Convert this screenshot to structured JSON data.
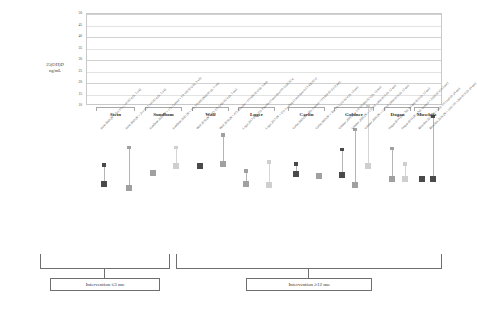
{
  "figure": {
    "ylabel_line1": "25(OH)D",
    "ylabel_line2": "ng/mL"
  },
  "brackets": [
    {
      "label": "Intervention ≤3 mo"
    },
    {
      "label": "Intervention ≥12 mo"
    }
  ],
  "chart_data": {
    "type": "scatter",
    "title": "",
    "xlabel": "",
    "ylabel": "25(OH)D ng/mL",
    "ylim": [
      10,
      50
    ],
    "yticks": [
      10,
      15,
      20,
      25,
      30,
      35,
      40,
      45,
      50
    ],
    "grid": true,
    "legend_position": "none",
    "series": [
      {
        "name": "Baseline 25(OH)D",
        "marker": "large-square"
      },
      {
        "name": "Post-intervention 25(OH)D",
        "marker": "small-square"
      }
    ],
    "groups": [
      {
        "study": "Stein",
        "bracket": "Intervention ≤3 mo",
        "arms": [
          {
            "label": "Stein 2009 (N = 21): D3 5,143 IU/d (6, 3 wk)",
            "baseline": 15.4,
            "post": 23.5,
            "shade": "dark"
          },
          {
            "label": "Stein 2009 (N = 21): D3 7,143 IU/d (6, 3 wk)",
            "baseline": 13.4,
            "post": 31.1,
            "shade": "mid"
          }
        ]
      },
      {
        "study": "Sundbom",
        "bracket": "Intervention ≤3 mo",
        "arms": [
          {
            "label": "Sundbom 2021 (N = 17): Control + D3 100 IU/d (6, 3 wk)",
            "baseline": 20.0,
            "post": null,
            "shade": "mid"
          },
          {
            "label": "Sundbom 2021 (N = 21): D3 800 (800) IU (6, 3 wk)",
            "baseline": 22.9,
            "post": 31.1,
            "shade": "light"
          }
        ]
      },
      {
        "study": "Wolf",
        "bracket": "Intervention ≤3 mo",
        "arms": [
          {
            "label": "Wolf 2016 (N = 47): D3 3,420 IU/d (6, 3 mo)",
            "baseline": 23.0,
            "post": null,
            "shade": "dark"
          },
          {
            "label": "Wolf 2016 (N = 47): Placebo + D3 600 IU/d (6, 3 mo)",
            "baseline": 23.9,
            "post": 36.5,
            "shade": "mid"
          }
        ]
      },
      {
        "study": "Luger",
        "bracket": "Intervention ≤3 mo",
        "arms": [
          {
            "label": "Luger 2017 (N = 25): Placebo (3 mo) then D3 3,420 IU/d",
            "baseline": 15.4,
            "post": 20.9,
            "shade": "mid"
          },
          {
            "label": "Luger 2017 (N = 25): Loading (3 mo) then D3 3,420 IU/d",
            "baseline": 15.0,
            "post": 24.8,
            "shade": "light"
          }
        ]
      },
      {
        "study": "Carlin",
        "bracket": "Intervention ≥12 mo",
        "arms": [
          {
            "label": "Carlin 2009 (N = 30): Control + D3 800 IU/d (12 mo)",
            "baseline": 19.7,
            "post": 23.9,
            "shade": "dark"
          },
          {
            "label": "Carlin 2009 (N = 30): D3 5,110 IU/d (6, 12 mo)",
            "baseline": 18.6,
            "post": null,
            "shade": "mid"
          }
        ]
      },
      {
        "study": "Goldner",
        "bracket": "Intervention ≥12 mo",
        "arms": [
          {
            "label": "Goldner 2009 (N = 15): D3 800 IU/d (6, 12 mo)",
            "baseline": 19.1,
            "post": 30.1,
            "shade": "dark"
          },
          {
            "label": "Goldner 2009 (N = 15): D3 1,800 IU/d (6, 12 mo)",
            "baseline": 15.0,
            "post": 38.9,
            "shade": "mid"
          },
          {
            "label": "Goldner 2009 (N = 15): D3 2,800 IU/d (6, 12 mo)",
            "baseline": 22.9,
            "post": 48.9,
            "shade": "light"
          }
        ]
      },
      {
        "study": "Dogan",
        "bracket": "Intervention ≥12 mo",
        "arms": [
          {
            "label": "Dogan 2014 (N = 76): D3 800 IU/d (6, 12 mo)",
            "baseline": 17.6,
            "post": 30.7,
            "shade": "mid"
          },
          {
            "label": "Dogan 2014 (N = 76): Control + 2,000 IU/d (12 mo)",
            "baseline": 17.6,
            "post": 23.9,
            "shade": "light"
          }
        ]
      },
      {
        "study": "Muschitz",
        "bracket": "Intervention ≥12 mo",
        "arms": [
          {
            "label": "Muschitz 2016 (N = 110): D3 Load (6, 24 mo)",
            "baseline": 17.4,
            "post": null,
            "shade": "dark"
          },
          {
            "label": "Muschitz 2016 (N = 110): D3 1,200 IU/d (6, 24 mo)",
            "baseline": 17.2,
            "post": 44.4,
            "shade": "dark"
          }
        ]
      }
    ]
  }
}
